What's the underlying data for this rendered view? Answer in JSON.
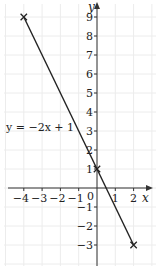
{
  "chart_data": {
    "type": "line",
    "title": "",
    "xlabel": "x",
    "ylabel": "y",
    "xlim": [
      -4.5,
      2.6
    ],
    "ylim": [
      -4,
      10
    ],
    "grid": true,
    "x_ticks": [
      -4,
      -3,
      -2,
      -1,
      0,
      1,
      2
    ],
    "y_ticks": [
      -3,
      -2,
      -1,
      1,
      2,
      3,
      4,
      5,
      6,
      7,
      8,
      9
    ],
    "series": [
      {
        "name": "y = −2x + 1",
        "x": [
          -4,
          0,
          2
        ],
        "y": [
          9,
          1,
          -3
        ],
        "markers": "x"
      }
    ],
    "annotations": [
      {
        "text": "y = −2x + 1",
        "x": -4.3,
        "y": 2.5
      }
    ]
  },
  "labels": {
    "x_axis": "x",
    "y_axis": "y",
    "equation": "y = −2x + 1",
    "origin": "0"
  }
}
